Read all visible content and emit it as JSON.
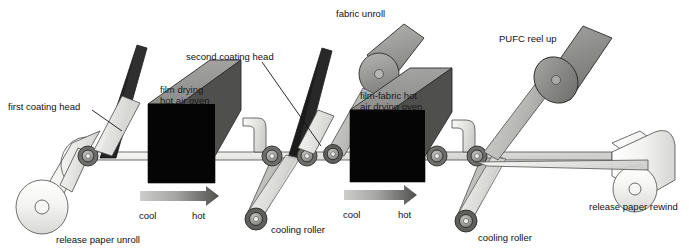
{
  "diagram": {
    "background_color": "#ffffff",
    "labels": {
      "first_coating_head": "first coating head",
      "second_coating_head": "second coating head",
      "fabric_unroll": "fabric unroll",
      "pufc_reel_up": "PUFC reel up",
      "film_drying_oven_line1": "film drying",
      "film_drying_oven_line2": "hot air oven",
      "film_fabric_oven_line1": "film-fabric hot",
      "film_fabric_oven_line2": "air drying oven",
      "release_paper_unroll": "release paper unroll",
      "release_paper_rewind": "release paper rewind",
      "cooling_roller_1": "cooling roller",
      "cooling_roller_2": "cooling roller",
      "cool_1": "cool",
      "hot_1": "hot",
      "cool_2": "cool",
      "hot_2": "hot"
    },
    "colors": {
      "background": "#ffffff",
      "paper_light": "#f2f2f0",
      "paper_mid": "#dcdcda",
      "web_gray": "#c9c9c7",
      "roller_gray": "#a8a8a6",
      "roller_dark": "#6e6e6c",
      "oven_top": "#9a9a98",
      "oven_side": "#4f4f4d",
      "oven_front": "#050505",
      "coating_head": "#1c1c1c",
      "fabric_roll": "#9c9c9a",
      "pufc_roll": "#8e8e8c",
      "arrow_cool": "#c2c2c0",
      "arrow_hot": "#5c5c5a",
      "outline": "#4a4a4a",
      "text": "#111111"
    },
    "arrows": [
      {
        "name": "temperature-gradient-arrow-1",
        "from_label": "cool",
        "to_label": "hot"
      },
      {
        "name": "temperature-gradient-arrow-2",
        "from_label": "cool",
        "to_label": "hot"
      }
    ],
    "components": [
      {
        "name": "release-paper-unroll-roll",
        "label": "release paper unroll"
      },
      {
        "name": "first-coating-head-blade",
        "label": "first coating head"
      },
      {
        "name": "film-drying-hot-air-oven",
        "label": "film drying hot air oven"
      },
      {
        "name": "second-coating-head-blade",
        "label": "second coating head"
      },
      {
        "name": "cooling-roller-1",
        "label": "cooling roller"
      },
      {
        "name": "fabric-unroll-roll",
        "label": "fabric unroll"
      },
      {
        "name": "film-fabric-hot-air-drying-oven",
        "label": "film-fabric hot air drying oven"
      },
      {
        "name": "cooling-roller-2",
        "label": "cooling roller"
      },
      {
        "name": "pufc-reel-up-roll",
        "label": "PUFC reel up"
      },
      {
        "name": "release-paper-rewind-roll",
        "label": "release paper rewind"
      }
    ]
  }
}
